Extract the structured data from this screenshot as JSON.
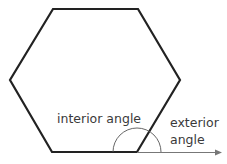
{
  "diagram": {
    "shape": "hexagon",
    "colors": {
      "outline": "#222222",
      "arc": "#555555",
      "arrow": "#777777",
      "text": "#3a3a3a",
      "background": "#ffffff"
    },
    "vertices": [
      [
        53,
        9
      ],
      [
        138,
        9
      ],
      [
        180,
        80
      ],
      [
        137,
        152
      ],
      [
        52,
        152
      ],
      [
        10,
        80
      ]
    ],
    "labels": {
      "interior": "interior angle",
      "exterior_line1": "exterior",
      "exterior_line2": "angle"
    }
  }
}
